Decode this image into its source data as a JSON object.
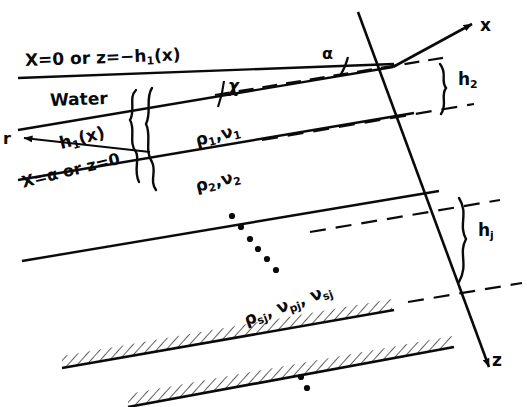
{
  "figure": {
    "type": "dipping-layered-earth-model",
    "labels": {
      "top_boundary": "X=0 or z=−h₁(x)",
      "water": "Water",
      "radial_axis": "r",
      "water_thickness": "h₁(x)",
      "seafloor_boundary": "X=α or z=0",
      "chi_angle": "χ",
      "alpha_angle": "α",
      "layer1_props": "ρ₁,ν₁",
      "layer2_props": "ρ₂,ν₂",
      "basement_props": "ρₛⱼ, νₚⱼ, νₛⱼ",
      "x_axis": "x",
      "z_axis": "z",
      "layer2_thickness": "h₂",
      "layerj_thickness": "hⱼ"
    },
    "label_parts": {
      "top_boundary_pre": "X=0 or z=",
      "top_boundary_h": "−h",
      "top_boundary_sub": "1",
      "top_boundary_post": "(x)",
      "h1_base": "h",
      "h1_sub": "1",
      "h1_post": "(x)",
      "xalpha_text": "X=α or z=0",
      "rho1_r": "ρ",
      "rho1_sub": "1",
      "rho1_sep": ",",
      "rho1_v": "ν",
      "rho1_vsub": "1",
      "rho2_sub": "2",
      "rho2_vsub": "2",
      "rhos_r": "ρ",
      "rhos_sub": "sj",
      "rhos_sep1": ", ",
      "rhos_vp": "ν",
      "rhos_vpsub": "pj",
      "rhos_sep2": ", ",
      "rhos_vs": "ν",
      "rhos_vssub": "sj",
      "h2_base": "h",
      "h2_sub": "2",
      "hj_base": "h",
      "hj_sub": "j"
    },
    "colors": {
      "ink": "#0a0a0a",
      "background": "#ffffff"
    },
    "dots": {
      "middle_ellipsis_count": 6,
      "bottom_ellipsis_count": 2
    }
  }
}
